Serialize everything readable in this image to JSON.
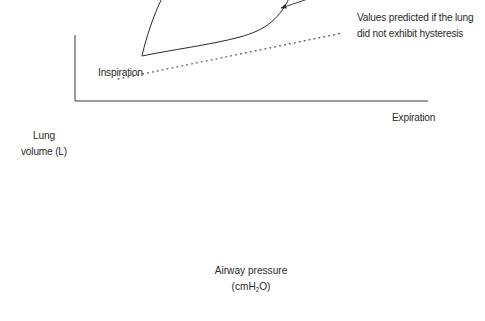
{
  "diagram": {
    "type": "pressure-volume hysteresis loop",
    "labels": {
      "inspiration": "Inspiration",
      "expiration": "Expiration",
      "prediction_line_1": "Values predicted if the lung",
      "prediction_line_2": "did not exhibit hysteresis"
    },
    "axes": {
      "y_label_line_1": "Lung",
      "y_label_line_2": "volume (L)",
      "x_label_line_1": "Airway pressure",
      "x_label_unit_prefix": "(cmH",
      "x_label_unit_sub": "2",
      "x_label_unit_suffix": "O)"
    },
    "colors": {
      "line": "#2a2a2a",
      "axis": "#3a3a3a",
      "dotted": "#3a3a3a",
      "background": "#ffffff"
    }
  }
}
